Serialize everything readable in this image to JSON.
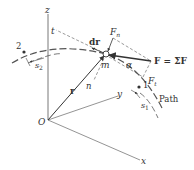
{
  "diagram": {
    "type": "kinematics-curvilinear-motion",
    "colors": {
      "ink": "#333333",
      "dash": "#555555",
      "background": "#ffffff"
    },
    "axes": {
      "z_label": "z",
      "y_label": "y",
      "x_label": "x",
      "origin_label": "O"
    },
    "vectors": {
      "position_label": "r",
      "displacement_label": "dr",
      "force_label": "F = ΣF",
      "normal_force_label": "F",
      "normal_force_sub": "n",
      "tangential_force_label": "F",
      "tangential_force_sub": "t"
    },
    "annotations": {
      "particle_label": "m",
      "tangent_label": "t",
      "normal_label": "n",
      "angle_label": "α",
      "path_label": "Path",
      "point_1_label": "1",
      "point_2_label": "2",
      "arc_1_label": "s",
      "arc_1_sub": "1",
      "arc_2_label": "s",
      "arc_2_sub": "2"
    }
  }
}
